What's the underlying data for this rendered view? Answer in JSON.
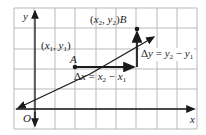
{
  "diagram": {
    "type": "coordinate-plane",
    "axes": {
      "x_label": "x",
      "y_label": "y",
      "origin_label": "O"
    },
    "points": [
      {
        "name": "A",
        "coord_label": "(x1, y1)"
      },
      {
        "name": "B",
        "coord_label": "(x2, y2)"
      }
    ],
    "annotations": {
      "delta_x": "Δx = x2 − x1",
      "delta_y": "Δy = y2 − y1"
    },
    "colors": {
      "grid": "#b9b9b9",
      "lines": "#1a1a1a",
      "background": "#ffffff"
    }
  }
}
